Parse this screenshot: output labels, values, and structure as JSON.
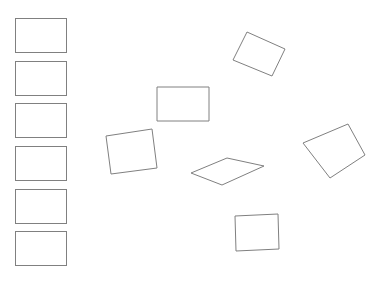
{
  "canvas": {
    "width": 385,
    "height": 283,
    "background_color": "#ffffff",
    "stroke_color": "#808080",
    "fill_color": "#ffffff",
    "stroke_width": 1
  },
  "reference_column": {
    "name": "reference-rectangle-column",
    "count": 6,
    "rectangles": [
      {
        "label": "reference-rectangle-1",
        "x": 15,
        "y": 18,
        "width": 51,
        "height": 34
      },
      {
        "label": "reference-rectangle-2",
        "x": 15,
        "y": 61,
        "width": 51,
        "height": 34
      },
      {
        "label": "reference-rectangle-3",
        "x": 15,
        "y": 103,
        "width": 51,
        "height": 34
      },
      {
        "label": "reference-rectangle-4",
        "x": 15,
        "y": 146,
        "width": 51,
        "height": 34
      },
      {
        "label": "reference-rectangle-5",
        "x": 15,
        "y": 189,
        "width": 51,
        "height": 34
      },
      {
        "label": "reference-rectangle-6",
        "x": 15,
        "y": 231,
        "width": 51,
        "height": 34
      }
    ]
  },
  "scattered_shapes": {
    "name": "scattered-quadrilateral-group",
    "count": 6,
    "quadrilaterals": [
      {
        "label": "tilted-rectangle-top-right",
        "points": "247,32 285,49 272,76 233,60"
      },
      {
        "label": "upright-rectangle-center",
        "points": "157,87 209,87 209,121 157,121"
      },
      {
        "label": "tilted-rectangle-left-middle",
        "points": "106,136 152,129 157,168 111,174"
      },
      {
        "label": "flat-parallelogram-center",
        "points": "191,173 227,158 264,166 222,185"
      },
      {
        "label": "tilted-quadrilateral-right",
        "points": "348,124 365,155 330,178 303,143"
      },
      {
        "label": "upright-rectangle-bottom",
        "points": "235,216 278,214 279,249 236,251"
      }
    ]
  }
}
